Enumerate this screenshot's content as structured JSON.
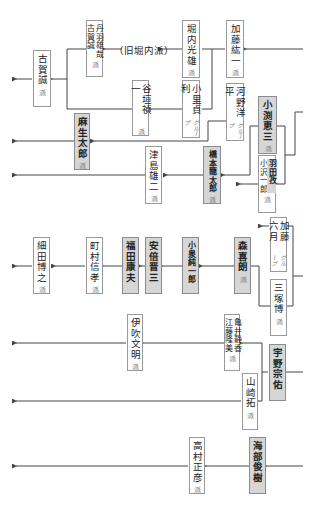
{
  "diagram": {
    "legend": {
      "pm_fill": "#d6d6d6",
      "box_fill": "#ffffff",
      "line_color": "#444444"
    },
    "annotations": {
      "old_horiuchi": "（旧堀内派）"
    },
    "nodes": {
      "koga": {
        "name": "古賀誠",
        "suffix": "派",
        "pm": false
      },
      "niwa_koga": {
        "name_a": "丹羽雄哉",
        "name_b": "古賀誠",
        "suffix": "派",
        "pm": false
      },
      "horiuchi": {
        "name": "堀内光雄",
        "suffix": "派",
        "pm": false
      },
      "kato_koichi": {
        "name": "加藤紘一",
        "suffix": "派",
        "pm": false
      },
      "tanigaki": {
        "name": "谷垣禎一",
        "suffix": "派",
        "pm": false
      },
      "komiyama": {
        "name": "小里貞利",
        "suffix": "グループ",
        "pm": false
      },
      "kono": {
        "name": "河野洋平",
        "suffix": "グループ",
        "pm": false
      },
      "aso": {
        "name": "麻生太郎",
        "suffix": "派",
        "pm": true
      },
      "obuchi": {
        "name": "小渕恵三",
        "suffix": "派",
        "pm": true
      },
      "tsushima": {
        "name": "津島雄二",
        "suffix": "派",
        "pm": false
      },
      "hashimoto": {
        "name": "橋本龍太郎",
        "suffix": "派",
        "pm": true
      },
      "hata_ozawa": {
        "name_a": "羽田孜",
        "name_b": "小沢一郎",
        "suffix": "派",
        "pm": true
      },
      "kato_mutsuki": {
        "name": "加藤六月",
        "suffix": "グループ",
        "pm": false
      },
      "hosoda": {
        "name": "細田博之",
        "suffix": "派",
        "pm": false
      },
      "machimura": {
        "name": "町村信孝",
        "suffix": "派",
        "pm": false
      },
      "fukuda": {
        "name": "福田康夫",
        "suffix": "",
        "pm": true
      },
      "abe": {
        "name": "安倍晋三",
        "suffix": "",
        "pm": true
      },
      "koizumi": {
        "name": "小泉純一郎",
        "suffix": "",
        "pm": true
      },
      "mori": {
        "name": "森喜朗",
        "suffix": "派",
        "pm": true
      },
      "mitsuzuka": {
        "name": "三塚博",
        "suffix": "派",
        "pm": false
      },
      "ibuki": {
        "name": "伊吹文明",
        "suffix": "派",
        "pm": false
      },
      "kamei_eto": {
        "name_a": "亀井静香",
        "name_b": "江藤隆美",
        "suffix": "派",
        "pm": false
      },
      "uno": {
        "name": "宇野宗佑",
        "suffix": "",
        "pm": true
      },
      "yamasaki": {
        "name": "山崎拓",
        "suffix": "派",
        "pm": false
      },
      "takamura": {
        "name": "高村正彦",
        "suffix": "派",
        "pm": false
      },
      "kaifu": {
        "name": "海部俊樹",
        "suffix": "",
        "pm": true
      }
    }
  }
}
